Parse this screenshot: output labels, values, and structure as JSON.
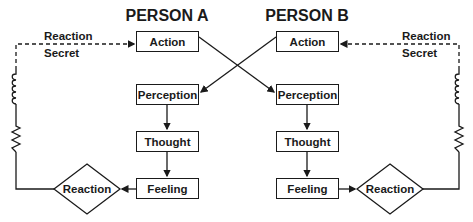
{
  "diagram": {
    "person_a": {
      "title": "PERSON A",
      "nodes": {
        "action": "Action",
        "perception": "Perception",
        "thought": "Thought",
        "feeling": "Feeling",
        "reaction": "Reaction"
      },
      "loop_label_1": "Reaction",
      "loop_label_2": "Secret"
    },
    "person_b": {
      "title": "PERSON B",
      "nodes": {
        "action": "Action",
        "perception": "Perception",
        "thought": "Thought",
        "feeling": "Feeling",
        "reaction": "Reaction"
      },
      "loop_label_1": "Reaction",
      "loop_label_2": "Secret"
    },
    "edges": [
      {
        "from": "A.action",
        "to": "B.perception",
        "style": "solid"
      },
      {
        "from": "B.action",
        "to": "A.perception",
        "style": "solid"
      },
      {
        "from": "A.perception",
        "to": "A.thought"
      },
      {
        "from": "A.thought",
        "to": "A.feeling"
      },
      {
        "from": "A.feeling",
        "to": "A.reaction"
      },
      {
        "from": "A.reaction",
        "to": "A.action",
        "style": "coil+resistor then dashed"
      },
      {
        "from": "B.perception",
        "to": "B.thought"
      },
      {
        "from": "B.thought",
        "to": "B.feeling"
      },
      {
        "from": "B.feeling",
        "to": "B.reaction"
      },
      {
        "from": "B.reaction",
        "to": "B.action",
        "style": "coil+resistor then dashed"
      }
    ],
    "line_color": "#1a1a1a"
  }
}
